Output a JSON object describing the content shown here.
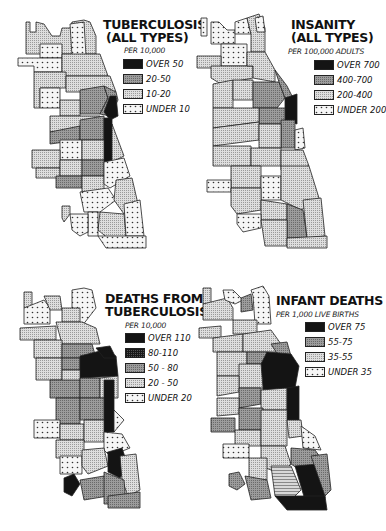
{
  "figure": {
    "panels": [
      {
        "id": "tuberculosis-all-types",
        "title_line1": "TUBERCULOSIS",
        "title_line2": "(ALL TYPES)",
        "unit": "PER 10,000",
        "legend": [
          {
            "label": "OVER 50",
            "fill": "black"
          },
          {
            "label": "20-50",
            "fill": "dark"
          },
          {
            "label": "10-20",
            "fill": "light"
          },
          {
            "label": "UNDER 10",
            "fill": "dots"
          }
        ]
      },
      {
        "id": "insanity-all-types",
        "title_line1": "INSANITY",
        "title_line2": "(ALL TYPES)",
        "unit": "PER 100,000 ADULTS",
        "legend": [
          {
            "label": "OVER 700",
            "fill": "black"
          },
          {
            "label": "400-700",
            "fill": "dark"
          },
          {
            "label": "200-400",
            "fill": "light"
          },
          {
            "label": "UNDER 200",
            "fill": "dots"
          }
        ]
      },
      {
        "id": "deaths-from-tuberculosis",
        "title_line1": "DEATHS FROM",
        "title_line2": "TUBERCULOSIS",
        "unit": "PER 10,000",
        "legend": [
          {
            "label": "OVER 110",
            "fill": "black"
          },
          {
            "label": "80-110",
            "fill": "nearblack"
          },
          {
            "label": "50 - 80",
            "fill": "dark"
          },
          {
            "label": "20 - 50",
            "fill": "light"
          },
          {
            "label": "UNDER 20",
            "fill": "dots"
          }
        ]
      },
      {
        "id": "infant-deaths",
        "title_line1": "INFANT DEATHS",
        "title_line2": "",
        "unit": "PER 1,000 LIVE BIRTHS",
        "legend": [
          {
            "label": "OVER 75",
            "fill": "black"
          },
          {
            "label": "55-75",
            "fill": "dark"
          },
          {
            "label": "35-55",
            "fill": "light"
          },
          {
            "label": "UNDER 35",
            "fill": "dots"
          }
        ]
      }
    ],
    "colors": {
      "black": "#141414",
      "nearblack": "#2a2a2a",
      "dark": "#8c8c8c",
      "light": "#cfcfcf",
      "dots_bg": "#f4f4f4",
      "border": "#222222"
    }
  }
}
